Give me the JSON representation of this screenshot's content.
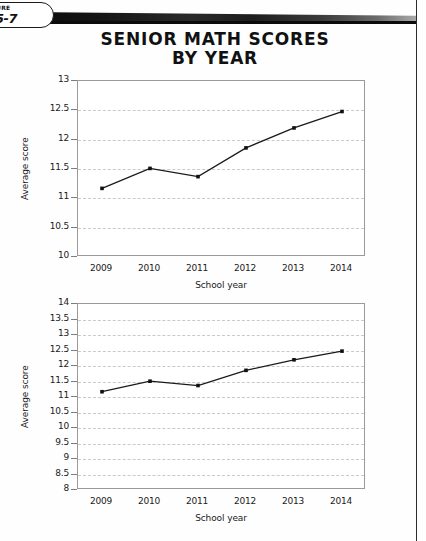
{
  "figure_tab": {
    "line1": "URE",
    "line2": "5-7"
  },
  "title": {
    "line1": "SENIOR MATH SCORES",
    "line2": "BY YEAR"
  },
  "colors": {
    "line": "#1a1a1a",
    "marker": "#111111",
    "grid": "#c9c9c9",
    "plot_border": "#9a9a9a",
    "text": "#1a1a1a",
    "page_rule": "#0b0b0b"
  },
  "chart_data": [
    {
      "id": "chart-top",
      "type": "line",
      "title": "SENIOR MATH SCORES BY YEAR",
      "xlabel": "School year",
      "ylabel": "Average score",
      "categories": [
        "2009",
        "2010",
        "2011",
        "2012",
        "2013",
        "2014"
      ],
      "values": [
        11.17,
        11.51,
        11.37,
        11.86,
        12.2,
        12.48
      ],
      "series": [
        {
          "name": "Average score",
          "values": [
            11.17,
            11.51,
            11.37,
            11.86,
            12.2,
            12.48
          ]
        }
      ],
      "ylim": [
        10,
        13
      ],
      "ytick_labels": [
        "10",
        "10.5",
        "11",
        "11.5",
        "12",
        "12.5",
        "13"
      ],
      "ytick_values": [
        10,
        10.5,
        11,
        11.5,
        12,
        12.5,
        13
      ],
      "grid": true,
      "legend": "none",
      "markers": true
    },
    {
      "id": "chart-bottom",
      "type": "line",
      "title": "",
      "xlabel": "School year",
      "ylabel": "Average score",
      "categories": [
        "2009",
        "2010",
        "2011",
        "2012",
        "2013",
        "2014"
      ],
      "values": [
        11.17,
        11.51,
        11.37,
        11.86,
        12.2,
        12.48
      ],
      "series": [
        {
          "name": "Average score",
          "values": [
            11.17,
            11.51,
            11.37,
            11.86,
            12.2,
            12.48
          ]
        }
      ],
      "ylim": [
        8,
        14
      ],
      "ytick_labels": [
        "8",
        "8.5",
        "9",
        "9.5",
        "10",
        "10.5",
        "11",
        "11.5",
        "12",
        "12.5",
        "13",
        "13.5",
        "14"
      ],
      "ytick_values": [
        8,
        8.5,
        9,
        9.5,
        10,
        10.5,
        11,
        11.5,
        12,
        12.5,
        13,
        13.5,
        14
      ],
      "grid": true,
      "legend": "none",
      "markers": true
    }
  ],
  "layout": {
    "chart_top": {
      "left": 77,
      "top": 80,
      "width": 288,
      "height": 176
    },
    "chart_bottom": {
      "left": 77,
      "top": 303,
      "width": 288,
      "height": 186
    }
  }
}
